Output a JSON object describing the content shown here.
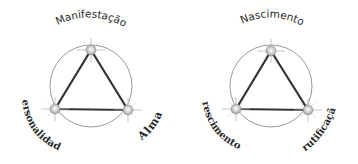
{
  "diagrams": [
    {
      "name": "left-triad",
      "top_label": "Manifestação",
      "bottom_left_label": "Personalidade",
      "bottom_right_label": "Alma"
    },
    {
      "name": "right-triad",
      "top_label": "Nascimento",
      "bottom_left_label": "crescimento",
      "bottom_right_label": "Frutificação"
    }
  ],
  "colors": {
    "circle": "#9a9a9a",
    "triangle": "#333333",
    "node": "#c8c8c8",
    "text": "#2a2a2a"
  }
}
